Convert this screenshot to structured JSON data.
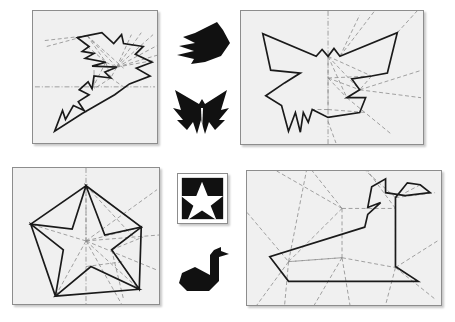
{
  "figure": {
    "background_color": "#ffffff",
    "paper_fill_color": "#f0f0f0",
    "paper_border_color": "#8d8d8d",
    "crease_line_color": "#8a8a8a",
    "outline_color": "#1a1a1a",
    "silhouette_color": "#111111",
    "width": 455,
    "height": 322
  },
  "panels": [
    {
      "id": "crease-pattern-fish",
      "label": "Angelfish crease pattern",
      "position": {
        "x": 32,
        "y": 10,
        "width": 126,
        "height": 134
      },
      "model": "angelfish",
      "paper_shape": "square",
      "outline_points": "55,25 45,27 57,36 50,41 62,43 53,48 74,52 60,56 85,57 73,62 79,68 62,66 60,79 56,72 47,80 57,85 46,92 52,101 41,96 33,110 30,101 22,122 50,104 83,85 98,74 119,66 105,58 121,52 104,44 112,36 92,33 90,24 82,33 70,22",
      "crease_lines": [
        {
          "type": "valley",
          "points": "12,30 55,25"
        },
        {
          "type": "valley",
          "points": "14,36 55,25"
        },
        {
          "type": "valley",
          "points": "55,25 74,52"
        },
        {
          "type": "valley",
          "points": "55,25 85,57"
        },
        {
          "type": "valley",
          "points": "55,25 92,58"
        },
        {
          "type": "valley",
          "points": "85,57 100,24"
        },
        {
          "type": "valley",
          "points": "85,57 110,22"
        },
        {
          "type": "valley",
          "points": "85,57 122,24"
        },
        {
          "type": "valley",
          "points": "85,57 130,33"
        },
        {
          "type": "valley",
          "points": "85,57 136,42"
        },
        {
          "type": "valley",
          "points": "85,57 140,50"
        },
        {
          "type": "valley",
          "points": "74,52 85,57"
        },
        {
          "type": "valley",
          "points": "74,52 79,68"
        },
        {
          "type": "valley",
          "points": "85,57 79,68"
        },
        {
          "type": "valley",
          "points": "79,68 62,79"
        },
        {
          "type": "valley",
          "points": "79,68 92,77"
        },
        {
          "type": "mountain",
          "points": "14,77 152,77"
        },
        {
          "type": "mountain",
          "points": "62,66 62,79"
        },
        {
          "type": "valley",
          "points": "60,79 74,52"
        }
      ]
    },
    {
      "id": "crease-pattern-butterfly",
      "label": "Butterfly crease pattern",
      "position": {
        "x": 240,
        "y": 10,
        "width": 184,
        "height": 135
      },
      "model": "butterfly",
      "paper_shape": "rectangle",
      "outline_points": "22,23 30,60 60,63 44,73 25,86 41,96 48,122 55,103 60,123 63,103 68,113 72,100 88,108 120,103 126,88 107,88 120,80 112,69 132,66 148,63 158,22 100,46 94,38 88,46 82,39 76,46",
      "crease_lines": [
        {
          "type": "mountain",
          "points": "88,2 88,133"
        },
        {
          "type": "valley",
          "points": "88,46 132,66"
        },
        {
          "type": "valley",
          "points": "88,46 120,80"
        },
        {
          "type": "valley",
          "points": "88,46 107,88"
        },
        {
          "type": "valley",
          "points": "100,46 120,12"
        },
        {
          "type": "valley",
          "points": "100,46 135,5"
        },
        {
          "type": "valley",
          "points": "158,22 176,2"
        },
        {
          "type": "valley",
          "points": "88,68 120,80"
        },
        {
          "type": "valley",
          "points": "88,68 132,66"
        },
        {
          "type": "valley",
          "points": "120,80 178,62"
        },
        {
          "type": "valley",
          "points": "120,80 176,88"
        },
        {
          "type": "valley",
          "points": "107,88 150,122"
        },
        {
          "type": "valley",
          "points": "88,68 107,88"
        },
        {
          "type": "valley",
          "points": "88,100 120,103"
        },
        {
          "type": "valley",
          "points": "88,100 72,100"
        }
      ]
    },
    {
      "id": "crease-pattern-star",
      "label": "Five-pointed star crease pattern",
      "position": {
        "x": 12,
        "y": 167,
        "width": 148,
        "height": 138
      },
      "model": "star",
      "paper_shape": "square",
      "outline_points": "74,18 93,68 130,60 100,83 128,123 79,100 43,130 51,83 18,57 60,62",
      "star_polygons": [
        "74,18 60,62 18,57",
        "74,18 93,68 130,60",
        "18,57 51,83 43,130",
        "130,60 128,123 100,83",
        "43,130 79,100 128,123"
      ],
      "crease_lines": [
        {
          "type": "mountain",
          "points": "74,5 74,132"
        },
        {
          "type": "valley",
          "points": "74,18 74,74"
        },
        {
          "type": "valley",
          "points": "74,74 130,60"
        },
        {
          "type": "valley",
          "points": "74,74 128,123"
        },
        {
          "type": "valley",
          "points": "74,74 18,57"
        },
        {
          "type": "valley",
          "points": "74,74 43,130"
        },
        {
          "type": "valley",
          "points": "74,18 130,60"
        },
        {
          "type": "valley",
          "points": "74,74 145,30"
        },
        {
          "type": "valley",
          "points": "74,74 146,75"
        },
        {
          "type": "valley",
          "points": "74,74 142,110"
        },
        {
          "type": "valley",
          "points": "74,74 108,134"
        },
        {
          "type": "valley",
          "points": "130,60 100,83"
        },
        {
          "type": "valley",
          "points": "100,83 128,123"
        },
        {
          "type": "valley",
          "points": "100,83 112,130"
        },
        {
          "type": "valley",
          "points": "74,100 110,96"
        }
      ]
    },
    {
      "id": "crease-pattern-swan",
      "label": "Swan crease pattern",
      "position": {
        "x": 246,
        "y": 170,
        "width": 196,
        "height": 136
      },
      "model": "swan",
      "paper_shape": "rectangle",
      "outline_points": "119,57 23,87 42,112 173,112 150,97 150,27 162,12 175,14 185,22 160,25 140,22 140,8 126,16 122,37 135,32 122,44",
      "crease_lines": [
        {
          "type": "valley",
          "points": "6,42 42,92"
        },
        {
          "type": "valley",
          "points": "42,92 60,6"
        },
        {
          "type": "valley",
          "points": "42,92 96,38"
        },
        {
          "type": "valley",
          "points": "42,92 96,88"
        },
        {
          "type": "valley",
          "points": "96,38 96,88"
        },
        {
          "type": "valley",
          "points": "96,38 66,4"
        },
        {
          "type": "valley",
          "points": "96,38 150,38"
        },
        {
          "type": "valley",
          "points": "96,88 150,98"
        },
        {
          "type": "valley",
          "points": "96,88 68,130"
        },
        {
          "type": "valley",
          "points": "96,88 104,130"
        },
        {
          "type": "valley",
          "points": "150,27 185,22"
        },
        {
          "type": "valley",
          "points": "150,27 120,2"
        },
        {
          "type": "valley",
          "points": "150,38 150,98"
        },
        {
          "type": "valley",
          "points": "150,98 190,72"
        },
        {
          "type": "valley",
          "points": "150,98 186,126"
        },
        {
          "type": "valley",
          "points": "150,98 140,132"
        },
        {
          "type": "valley",
          "points": "96,88 42,92"
        },
        {
          "type": "valley",
          "points": "150,38 122,2"
        }
      ]
    }
  ],
  "silhouettes": [
    {
      "id": "silhouette-fish",
      "label": "Folded angelfish model",
      "alt": "black origami angelfish pointing right",
      "position": {
        "x": 171,
        "y": 19,
        "width": 60,
        "height": 48
      },
      "shape_points": "46,3 24,14 12,18 24,24 8,27 23,32 6,36 23,40 20,45 34,43 50,37 59,24 52,11"
    },
    {
      "id": "silhouette-butterfly",
      "label": "Folded butterfly model",
      "alt": "black origami butterfly with spread wings",
      "position": {
        "x": 171,
        "y": 86,
        "width": 62,
        "height": 50
      },
      "shape_points": "4,4 10,24 2,22 12,34 6,34 16,44 22,36 26,48 30,34 34,48 38,36 44,44 54,34 48,34 58,22 50,24 56,4 34,18 31,13 28,18"
    },
    {
      "id": "tile-star",
      "label": "Folded star model tile",
      "alt": "black square tile with white five-pointed star",
      "position": {
        "x": 177,
        "y": 173,
        "width": 51,
        "height": 51
      },
      "tile_background": "#111111",
      "star_points": "25,8 31,23 47,23 34,33 40,48 25,38 10,48 16,33 3,23 19,23"
    },
    {
      "id": "silhouette-swan",
      "label": "Folded swan model",
      "alt": "black origami swan facing right",
      "position": {
        "x": 177,
        "y": 245,
        "width": 56,
        "height": 50
      },
      "shape_points": "37,5 33,10 33,30 18,22 5,28 2,38 10,46 32,46 42,36 42,12 52,9 44,6 44,2"
    }
  ]
}
